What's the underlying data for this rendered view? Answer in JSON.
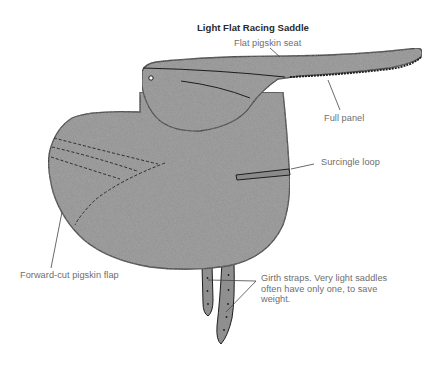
{
  "figure": {
    "title": "Light Flat Racing Saddle",
    "colors": {
      "leather_fill": "#8f8f8f",
      "outline": "#1e1e1e",
      "label_text": "#6e6e6e",
      "title_text": "#2a2a2a",
      "leader_line": "#444444",
      "background": "#ffffff"
    },
    "labels": [
      {
        "id": "seat",
        "text": "Flat pigskin seat"
      },
      {
        "id": "panel",
        "text": "Full panel"
      },
      {
        "id": "surcingle",
        "text": "Surcingle loop"
      },
      {
        "id": "flap",
        "text": "Forward-cut pigskin flap"
      },
      {
        "id": "girth",
        "lines": [
          "Girth straps. Very light saddles",
          "often have only one, to save",
          "weight."
        ]
      }
    ]
  }
}
